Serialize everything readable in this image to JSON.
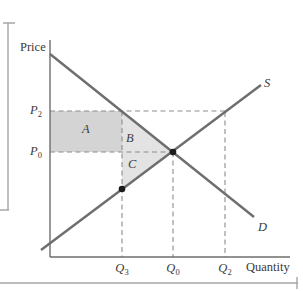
{
  "axes": {
    "y_axis_label": "Price",
    "x_axis_label": "Quantity"
  },
  "curves": {
    "supply_label": "S",
    "demand_label": "D"
  },
  "regions": {
    "a_label": "A",
    "b_label": "B",
    "c_label": "C"
  },
  "price_ticks": {
    "p2": {
      "main": "P",
      "sub": "2"
    },
    "p0": {
      "main": "P",
      "sub": "0"
    }
  },
  "quantity_ticks": {
    "q3": {
      "main": "Q",
      "sub": "3"
    },
    "q0": {
      "main": "Q",
      "sub": "0"
    },
    "q2": {
      "main": "Q",
      "sub": "2"
    }
  },
  "colors": {
    "background": "#ffffff",
    "region_a_fill": "#d4d4d4",
    "region_b_fill": "#e3e3e3",
    "region_c_fill": "#e3e3e3",
    "axis_line": "#6e6e6e",
    "curve_line": "#6e6e6e",
    "dashed_line": "#8c8c8c",
    "page_frame_line": "#a6a6a6",
    "dot": "#1c1c1c",
    "text": "#3a3a3a"
  }
}
